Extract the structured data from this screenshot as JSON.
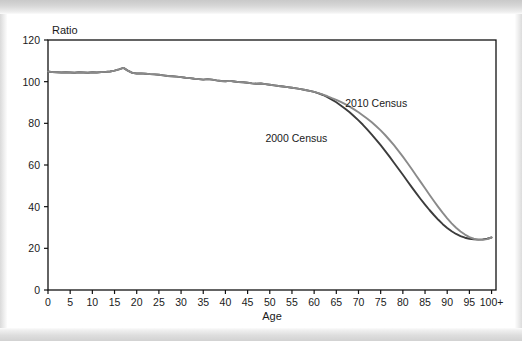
{
  "figure": {
    "axis_label_ratio": "Ratio",
    "axis_label_age": "Age"
  },
  "series_labels": {
    "census_2010": "2010 Census",
    "census_2000": "2000 Census"
  },
  "colors": {
    "census_2000_line": "#3c3c3c",
    "census_2010_line": "#8a8a8a",
    "axis": "#111111",
    "plot_background": "#ffffff"
  },
  "chart_data": {
    "type": "line",
    "title": "",
    "subtitle": "",
    "xlabel": "Age",
    "ylabel": "Ratio",
    "xlim": [
      0,
      101
    ],
    "ylim": [
      0,
      120
    ],
    "grid": false,
    "legend_position": "inline-annotation",
    "x_tick_labels": [
      "0",
      "5",
      "10",
      "15",
      "20",
      "25",
      "30",
      "35",
      "40",
      "45",
      "50",
      "55",
      "60",
      "65",
      "70",
      "75",
      "80",
      "85",
      "90",
      "95",
      "100+"
    ],
    "x_tick_values": [
      0,
      5,
      10,
      15,
      20,
      25,
      30,
      35,
      40,
      45,
      50,
      55,
      60,
      65,
      70,
      75,
      80,
      85,
      90,
      95,
      100
    ],
    "y_tick_labels": [
      "0",
      "20",
      "40",
      "60",
      "80",
      "100",
      "120"
    ],
    "y_tick_values": [
      0,
      20,
      40,
      60,
      80,
      100,
      120
    ],
    "x": [
      0,
      1,
      2,
      3,
      4,
      5,
      6,
      7,
      8,
      9,
      10,
      11,
      12,
      13,
      14,
      15,
      16,
      17,
      18,
      19,
      20,
      21,
      22,
      23,
      24,
      25,
      26,
      27,
      28,
      29,
      30,
      31,
      32,
      33,
      34,
      35,
      36,
      37,
      38,
      39,
      40,
      41,
      42,
      43,
      44,
      45,
      46,
      47,
      48,
      49,
      50,
      51,
      52,
      53,
      54,
      55,
      56,
      57,
      58,
      59,
      60,
      61,
      62,
      63,
      64,
      65,
      66,
      67,
      68,
      69,
      70,
      71,
      72,
      73,
      74,
      75,
      76,
      77,
      78,
      79,
      80,
      81,
      82,
      83,
      84,
      85,
      86,
      87,
      88,
      89,
      90,
      91,
      92,
      93,
      94,
      95,
      96,
      97,
      98,
      99,
      100
    ],
    "series": [
      {
        "name": "2010 Census",
        "color": "#8a8a8a",
        "label_x": 74,
        "label_y": 88,
        "values": [
          104.9,
          104.6,
          104.5,
          104.4,
          104.5,
          104.4,
          104.3,
          104.5,
          104.4,
          104.3,
          104.5,
          104.4,
          104.6,
          104.7,
          104.9,
          105.3,
          105.9,
          106.6,
          105.3,
          104.2,
          103.9,
          104.0,
          103.8,
          103.6,
          103.5,
          103.3,
          103.0,
          102.7,
          102.6,
          102.4,
          102.2,
          101.9,
          101.7,
          101.4,
          101.2,
          101.0,
          101.2,
          101.0,
          100.6,
          100.3,
          100.2,
          100.4,
          100.1,
          99.8,
          99.7,
          99.5,
          99.2,
          99.0,
          99.1,
          98.8,
          98.5,
          98.2,
          97.9,
          97.7,
          97.4,
          97.1,
          96.8,
          96.4,
          96.0,
          95.6,
          95.1,
          94.5,
          93.8,
          93.0,
          92.1,
          91.3,
          90.3,
          89.2,
          88.0,
          86.7,
          85.3,
          83.8,
          82.2,
          80.5,
          78.6,
          76.6,
          74.4,
          72.0,
          69.5,
          66.8,
          64.0,
          61.1,
          58.1,
          55.0,
          51.9,
          48.8,
          45.7,
          42.7,
          39.8,
          37.0,
          34.4,
          32.0,
          29.9,
          28.1,
          26.6,
          25.4,
          24.6,
          24.2,
          24.1,
          24.4,
          25.2
        ]
      },
      {
        "name": "2000 Census",
        "color": "#3c3c3c",
        "label_x": 56,
        "label_y": 71,
        "values": [
          104.9,
          104.6,
          104.5,
          104.4,
          104.5,
          104.4,
          104.3,
          104.5,
          104.4,
          104.3,
          104.5,
          104.4,
          104.6,
          104.7,
          104.9,
          105.3,
          105.9,
          106.6,
          105.3,
          104.2,
          103.9,
          104.0,
          103.8,
          103.6,
          103.5,
          103.3,
          103.0,
          102.7,
          102.6,
          102.4,
          102.2,
          101.9,
          101.7,
          101.4,
          101.2,
          101.0,
          101.2,
          101.0,
          100.6,
          100.3,
          100.2,
          100.4,
          100.1,
          99.8,
          99.7,
          99.5,
          99.2,
          99.0,
          99.1,
          98.8,
          98.5,
          98.2,
          97.9,
          97.7,
          97.4,
          97.1,
          96.8,
          96.4,
          96.0,
          95.6,
          95.1,
          94.4,
          93.6,
          92.6,
          91.4,
          90.1,
          88.6,
          87.0,
          85.3,
          83.4,
          81.4,
          79.3,
          77.0,
          74.6,
          72.1,
          69.5,
          66.8,
          64.0,
          61.1,
          58.2,
          55.3,
          52.3,
          49.4,
          46.5,
          43.7,
          41.0,
          38.4,
          36.0,
          33.7,
          31.6,
          29.8,
          28.2,
          26.9,
          25.9,
          25.1,
          24.6,
          24.3,
          24.2,
          24.3,
          24.6,
          25.2
        ]
      }
    ]
  }
}
